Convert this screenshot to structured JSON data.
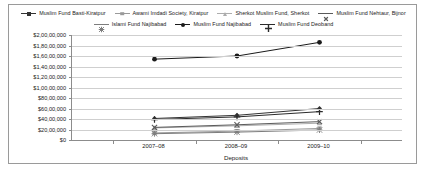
{
  "chart_data": {
    "type": "line",
    "title": "",
    "subtitle": "",
    "xlabel": "Deposits",
    "ylabel": "",
    "categories": [
      "2007–08",
      "2008–09",
      "2009–10"
    ],
    "ylim": [
      0,
      20000000
    ],
    "ytick_step": 2000000,
    "ytick_labels": [
      "$2,00,00,000",
      "$1,80,00,000",
      "$1,60,00,000",
      "$1,40,00,000",
      "$1,20,00,000",
      "$1,00,00,000",
      "$80,00,000",
      "$60,00,000",
      "$40,00,000",
      "$20,00,000",
      "$0"
    ],
    "ytick_values": [
      20000000,
      18000000,
      16000000,
      14000000,
      12000000,
      10000000,
      8000000,
      6000000,
      4000000,
      2000000,
      0
    ],
    "grid": true,
    "legend_position": "top",
    "legend_rows": [
      4,
      3
    ],
    "series": [
      {
        "name": "Muslim Fund Basti-Kiratpur",
        "marker": "diamond",
        "color": "#333333",
        "values": [
          4100000,
          4700000,
          6000000
        ]
      },
      {
        "name": "Awami Imdadi Society, Kiratpur",
        "marker": "square",
        "color": "#9a9a9a",
        "values": [
          1350000,
          1700000,
          2200000
        ]
      },
      {
        "name": "Sherkot Muslim Fund, Sherkot",
        "marker": "triangle",
        "color": "#adadad",
        "values": [
          2300000,
          2700000,
          3200000
        ]
      },
      {
        "name": "Muslim Fund Nehtaur, Bijnor",
        "marker": "x",
        "color": "#5a5a5a",
        "values": [
          2400000,
          2900000,
          3500000
        ]
      },
      {
        "name": "Islami Fund Najibabad",
        "marker": "star",
        "color": "#7d7d7d",
        "values": [
          1200000,
          1500000,
          1900000
        ]
      },
      {
        "name": "Muslim Fund Najibabad",
        "marker": "circle",
        "color": "#1a1a1a",
        "values": [
          15400000,
          16000000,
          18600000
        ]
      },
      {
        "name": "Muslim Fund Deoband",
        "marker": "plus",
        "color": "#2b2b2b",
        "values": [
          3900000,
          4400000,
          5400000
        ]
      }
    ]
  }
}
